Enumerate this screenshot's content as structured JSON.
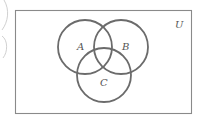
{
  "diagram": {
    "type": "venn",
    "universe_label": "U",
    "sets": [
      {
        "label": "A",
        "cx": 85,
        "cy": 47,
        "r": 27
      },
      {
        "label": "B",
        "cx": 121,
        "cy": 47,
        "r": 27
      },
      {
        "label": "C",
        "cx": 104,
        "cy": 75,
        "r": 27
      }
    ],
    "colors": {
      "circle_stroke": "#6b6b6b",
      "rect_stroke": "#8a8a8a",
      "scan_edge": "#c4c4c4",
      "label": "#555555"
    }
  }
}
